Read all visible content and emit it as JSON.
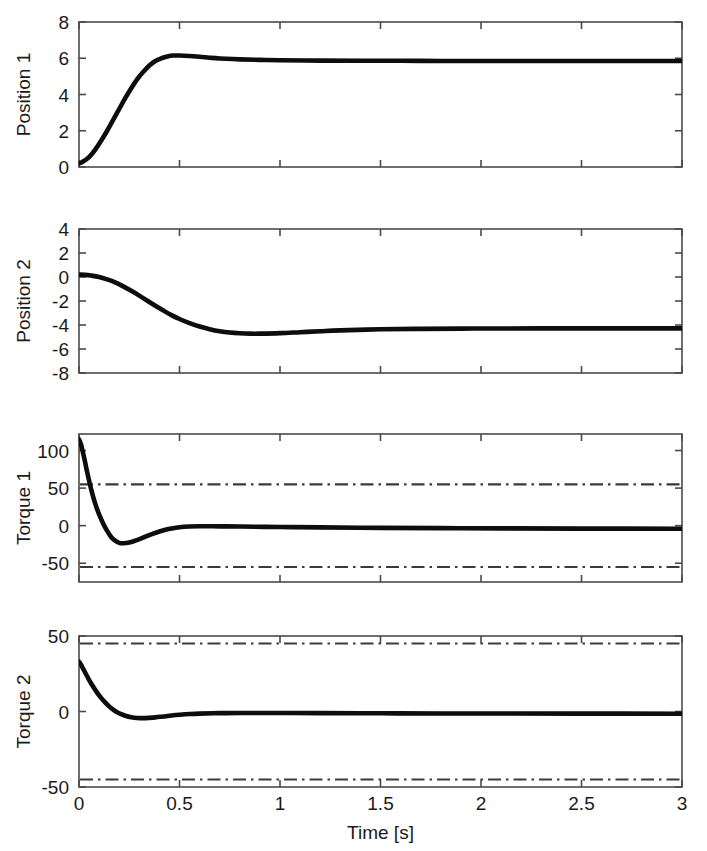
{
  "figure": {
    "width": 707,
    "height": 851,
    "background": "#ffffff",
    "curve_color": "#0d0d0d",
    "limit_color": "#3a3a3a",
    "axis_color": "#4a4a4a",
    "xlabel": "Time [s]",
    "shared_x": {
      "min": 0,
      "max": 3,
      "ticks": [
        0,
        0.5,
        1,
        1.5,
        2,
        2.5,
        3
      ],
      "tick_labels": [
        "0",
        "0.5",
        "1",
        "1.5",
        "2",
        "2.5",
        "3"
      ]
    }
  },
  "chart_data": [
    {
      "type": "line",
      "panel_index": 0,
      "title": "",
      "ylabel": "Position 1",
      "xlabel": "",
      "xlim": [
        0,
        3
      ],
      "ylim": [
        0,
        8
      ],
      "yticks": [
        0,
        2,
        4,
        6,
        8
      ],
      "ytick_labels": [
        "0",
        "2",
        "4",
        "6",
        "8"
      ],
      "xticks": [
        0,
        0.5,
        1,
        1.5,
        2,
        2.5,
        3
      ],
      "xtick_labels": [
        "",
        "",
        "",
        "",
        "",
        "",
        ""
      ],
      "grid": false,
      "legend": "none",
      "series": [
        {
          "name": "Position 1",
          "style": "solid",
          "x": [
            0,
            0.02,
            0.05,
            0.08,
            0.11,
            0.14,
            0.17,
            0.2,
            0.23,
            0.26,
            0.29,
            0.32,
            0.35,
            0.38,
            0.41,
            0.44,
            0.47,
            0.5,
            0.55,
            0.6,
            0.65,
            0.7,
            0.8,
            0.9,
            1.0,
            1.2,
            1.4,
            1.6,
            1.8,
            2.0,
            2.2,
            2.4,
            2.6,
            2.8,
            3.0
          ],
          "y": [
            0.2,
            0.3,
            0.55,
            0.95,
            1.45,
            2.0,
            2.6,
            3.2,
            3.8,
            4.35,
            4.85,
            5.25,
            5.6,
            5.85,
            6.0,
            6.1,
            6.15,
            6.15,
            6.12,
            6.08,
            6.03,
            5.99,
            5.94,
            5.91,
            5.89,
            5.87,
            5.86,
            5.86,
            5.85,
            5.85,
            5.85,
            5.85,
            5.85,
            5.85,
            5.85
          ]
        }
      ],
      "limit_lines": []
    },
    {
      "type": "line",
      "panel_index": 1,
      "title": "",
      "ylabel": "Position 2",
      "xlabel": "",
      "xlim": [
        0,
        3
      ],
      "ylim": [
        -8,
        4
      ],
      "yticks": [
        -8,
        -6,
        -4,
        -2,
        0,
        2,
        4
      ],
      "ytick_labels": [
        "-8",
        "-6",
        "-4",
        "-2",
        "0",
        "2",
        "4"
      ],
      "xticks": [
        0,
        0.5,
        1,
        1.5,
        2,
        2.5,
        3
      ],
      "xtick_labels": [
        "",
        "",
        "",
        "",
        "",
        "",
        ""
      ],
      "grid": false,
      "legend": "none",
      "series": [
        {
          "name": "Position 2",
          "style": "solid",
          "x": [
            0,
            0.03,
            0.06,
            0.1,
            0.14,
            0.18,
            0.22,
            0.26,
            0.3,
            0.34,
            0.38,
            0.42,
            0.46,
            0.5,
            0.55,
            0.6,
            0.65,
            0.7,
            0.75,
            0.8,
            0.85,
            0.9,
            1.0,
            1.1,
            1.2,
            1.3,
            1.5,
            1.7,
            1.9,
            2.1,
            2.4,
            2.7,
            3.0
          ],
          "y": [
            0.2,
            0.18,
            0.12,
            0.0,
            -0.2,
            -0.45,
            -0.78,
            -1.15,
            -1.55,
            -1.98,
            -2.4,
            -2.8,
            -3.18,
            -3.5,
            -3.85,
            -4.13,
            -4.35,
            -4.52,
            -4.63,
            -4.69,
            -4.72,
            -4.72,
            -4.68,
            -4.6,
            -4.52,
            -4.45,
            -4.36,
            -4.32,
            -4.3,
            -4.29,
            -4.28,
            -4.28,
            -4.28
          ]
        }
      ],
      "limit_lines": []
    },
    {
      "type": "line",
      "panel_index": 2,
      "title": "",
      "ylabel": "Torque 1",
      "xlabel": "",
      "xlim": [
        0,
        3
      ],
      "ylim": [
        -75,
        122
      ],
      "yticks": [
        -50,
        0,
        50,
        100
      ],
      "ytick_labels": [
        "-50",
        "0",
        "50",
        "100"
      ],
      "xticks": [
        0,
        0.5,
        1,
        1.5,
        2,
        2.5,
        3
      ],
      "xtick_labels": [
        "",
        "",
        "",
        "",
        "",
        "",
        ""
      ],
      "grid": false,
      "legend": "none",
      "series": [
        {
          "name": "Torque 1",
          "style": "solid",
          "x": [
            0,
            0.01,
            0.02,
            0.03,
            0.04,
            0.05,
            0.06,
            0.07,
            0.08,
            0.09,
            0.1,
            0.12,
            0.14,
            0.16,
            0.18,
            0.2,
            0.22,
            0.25,
            0.28,
            0.31,
            0.34,
            0.37,
            0.4,
            0.43,
            0.46,
            0.5,
            0.55,
            0.6,
            0.7,
            0.8,
            1.0,
            1.2,
            1.5,
            1.8,
            2.1,
            2.5,
            3.0
          ],
          "y": [
            115,
            108,
            97,
            85,
            72,
            60,
            49,
            39,
            30,
            22,
            15,
            3,
            -7,
            -15,
            -20,
            -23,
            -23.5,
            -22.5,
            -20,
            -17,
            -13.5,
            -10.5,
            -7.8,
            -5.5,
            -3.8,
            -2.2,
            -1.2,
            -0.8,
            -0.9,
            -1.2,
            -1.8,
            -2.3,
            -2.9,
            -3.3,
            -3.6,
            -3.9,
            -4.1
          ]
        }
      ],
      "limit_lines": [
        {
          "name": "upper torque limit",
          "value": 55,
          "style": "dash-dot"
        },
        {
          "name": "lower torque limit",
          "value": -55,
          "style": "dash-dot"
        }
      ]
    },
    {
      "type": "line",
      "panel_index": 3,
      "title": "",
      "ylabel": "Torque 2",
      "xlabel": "Time [s]",
      "xlim": [
        0,
        3
      ],
      "ylim": [
        -50,
        50
      ],
      "yticks": [
        -50,
        0,
        50
      ],
      "ytick_labels": [
        "-50",
        "0",
        "50"
      ],
      "xticks": [
        0,
        0.5,
        1,
        1.5,
        2,
        2.5,
        3
      ],
      "xtick_labels": [
        "0",
        "0.5",
        "1",
        "1.5",
        "2",
        "2.5",
        "3"
      ],
      "grid": false,
      "legend": "none",
      "series": [
        {
          "name": "Torque 2",
          "style": "solid",
          "x": [
            0,
            0.01,
            0.02,
            0.03,
            0.05,
            0.07,
            0.09,
            0.11,
            0.13,
            0.15,
            0.17,
            0.19,
            0.21,
            0.23,
            0.26,
            0.29,
            0.32,
            0.35,
            0.38,
            0.42,
            0.46,
            0.5,
            0.55,
            0.6,
            0.7,
            0.8,
            1.0,
            1.2,
            1.5,
            1.8,
            2.1,
            2.5,
            3.0
          ],
          "y": [
            33,
            31,
            28.5,
            26,
            21,
            16.5,
            12.5,
            9,
            6,
            3.4,
            1.2,
            -0.5,
            -1.8,
            -2.8,
            -3.8,
            -4.3,
            -4.4,
            -4.2,
            -3.9,
            -3.3,
            -2.7,
            -2.2,
            -1.7,
            -1.4,
            -1.1,
            -1.0,
            -1.0,
            -1.1,
            -1.2,
            -1.3,
            -1.35,
            -1.4,
            -1.45
          ]
        }
      ],
      "limit_lines": [
        {
          "name": "upper torque limit",
          "value": 45,
          "style": "dash-dot"
        },
        {
          "name": "lower torque limit",
          "value": -45,
          "style": "dash-dot"
        }
      ]
    }
  ]
}
